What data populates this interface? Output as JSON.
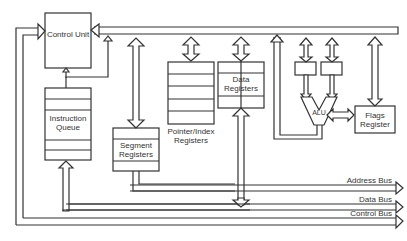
{
  "diagram": {
    "blocks": {
      "control_unit": "Control Unit",
      "instruction_queue": "Instruction Queue",
      "segment_registers": "Segment Registers",
      "pointer_index_registers": "Pointer/Index Registers",
      "data_registers": "Data Registers",
      "alu": "ALU",
      "flags_register": "Flags Register"
    },
    "buses": {
      "address": "Address Bus",
      "data": "Data Bus",
      "control": "Control Bus"
    },
    "colors": {
      "stroke": "#333333",
      "background": "#ffffff"
    }
  }
}
